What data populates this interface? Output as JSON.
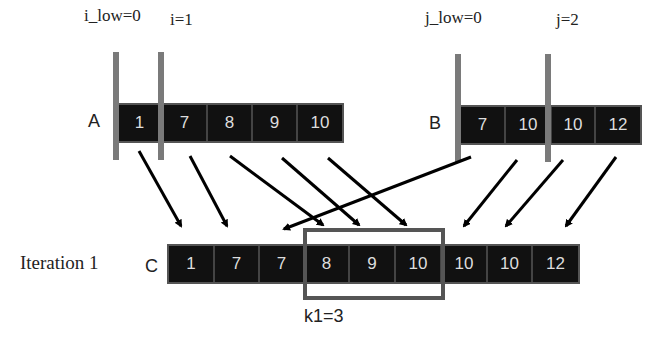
{
  "pointers": {
    "i_low": "i_low=0",
    "i": "i=1",
    "j_low": "j_low=0",
    "j": "j=2"
  },
  "arrays": {
    "A": {
      "label": "A",
      "values": [
        "1",
        "7",
        "8",
        "9",
        "10"
      ]
    },
    "B": {
      "label": "B",
      "values": [
        "7",
        "10",
        "10",
        "12"
      ]
    },
    "C": {
      "label": "C",
      "values": [
        "1",
        "7",
        "7",
        "8",
        "9",
        "10",
        "10",
        "10",
        "12"
      ]
    }
  },
  "iteration_label": "Iteration 1",
  "highlight_label": "k1=3",
  "colors": {
    "cell_bg": "#111111",
    "pointer_bar": "#7a7a7a",
    "highlight_box": "#555555"
  }
}
